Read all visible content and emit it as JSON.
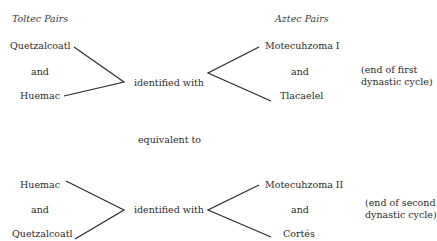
{
  "headers": {
    "left": "Toltec Pairs",
    "right": "Aztec Pairs"
  },
  "cycles": [
    {
      "toltec": [
        "Quetzalcoatl",
        "and",
        "Huemac"
      ],
      "relation": "identified with",
      "aztec": [
        "Motecuhzoma I",
        "and",
        "Tlacaelel"
      ],
      "note": [
        "(end of first",
        "dynastic cycle)"
      ]
    },
    {
      "toltec": [
        "Huemac",
        "and",
        "Quetzalcoatl"
      ],
      "relation": "identified with",
      "aztec": [
        "Motecuhzoma II",
        "and",
        "Cortés"
      ],
      "note": [
        "(end of second",
        "dynastic cycle)"
      ]
    }
  ],
  "connector": "equivalent to",
  "colors": {
    "line": "#2a2a2a",
    "text": "#2a2a2a"
  }
}
